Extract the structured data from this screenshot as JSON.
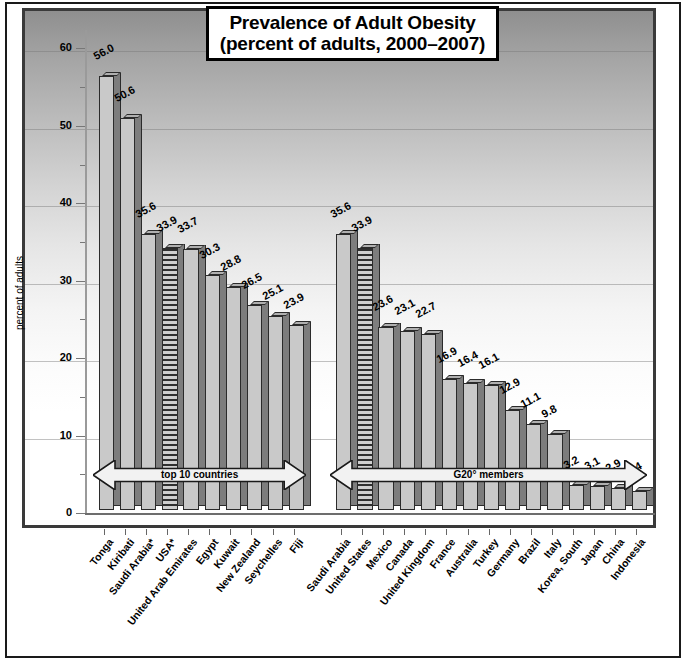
{
  "chart_data": {
    "type": "bar",
    "title": "Prevalence of Adult Obesity",
    "subtitle": "(percent of adults, 2000–2007)",
    "xlabel": "",
    "ylabel": "percent of adults",
    "ylim": [
      0,
      62
    ],
    "ytick_labels": [
      "0",
      "10",
      "20",
      "30",
      "40",
      "50",
      "60"
    ],
    "ytick_values": [
      0,
      10,
      20,
      30,
      40,
      50,
      60
    ],
    "minor_tick_step": 5,
    "grid": true,
    "legend_position": "none",
    "groups": [
      {
        "name": "top 10 countries",
        "annotation": "top 10 countries",
        "categories": [
          "Tonga",
          "Kiribati",
          "Saudi Arabia*",
          "USA*",
          "United Arab Emirates",
          "Egypt",
          "Kuwait",
          "New Zealand",
          "Seychelles",
          "Fiji"
        ],
        "values": [
          56.0,
          50.6,
          35.6,
          33.9,
          33.7,
          30.3,
          28.8,
          26.5,
          25.1,
          23.9
        ],
        "value_labels": [
          "56.0",
          "50.6",
          "35.6",
          "33.9",
          "33.7",
          "30.3",
          "28.8",
          "26.5",
          "25.1",
          "23.9"
        ],
        "highlighted": [
          "USA*"
        ]
      },
      {
        "name": "G20 members",
        "annotation": "G20° members",
        "categories": [
          "Saudi Arabia",
          "United States",
          "Mexico",
          "Canada",
          "United Kingdom",
          "France",
          "Australia",
          "Turkey",
          "Germany",
          "Brazil",
          "Italy",
          "Korea, South",
          "Japan",
          "China",
          "Indonesia"
        ],
        "values": [
          35.6,
          33.9,
          23.6,
          23.1,
          22.7,
          16.9,
          16.4,
          16.1,
          12.9,
          11.1,
          9.8,
          3.2,
          3.1,
          2.9,
          2.4
        ],
        "value_labels": [
          "35.6",
          "33.9",
          "23.6",
          "23.1",
          "22.7",
          "16.9",
          "16.4",
          "16.1",
          "12.9",
          "11.1",
          "9.8",
          "3.2",
          "3.1",
          "2.9",
          "2.4"
        ],
        "highlighted": [
          "United States"
        ]
      }
    ],
    "colors": {
      "bar_face": "#c9c9c9",
      "bar_side": "#7d7d7d",
      "bar_outline": "#2b2b2b",
      "highlight_pattern": "horizontal-stripes",
      "panel_gradient_top": "#8f8f8f",
      "panel_gradient_bottom": "#ffffff",
      "title_border": "#000000"
    }
  }
}
